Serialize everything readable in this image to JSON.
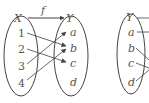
{
  "diagram": {
    "type": "function-mapping",
    "function_label": "f",
    "domain_set": {
      "label": "X",
      "elements": [
        "1",
        "2",
        "3",
        "4"
      ]
    },
    "codomain_set": {
      "label": "Y",
      "elements": [
        "a",
        "b",
        "c",
        "d"
      ]
    },
    "mappings": [
      {
        "from": "1",
        "to": "b"
      },
      {
        "from": "2",
        "to": "c"
      },
      {
        "from": "3",
        "to": "a"
      },
      {
        "from": "4",
        "to": "b"
      }
    ],
    "second_set": {
      "label": "Y",
      "elements": [
        "a",
        "b",
        "c",
        "d"
      ]
    },
    "colors": {
      "stroke": "#444444",
      "text": "#555555"
    }
  }
}
